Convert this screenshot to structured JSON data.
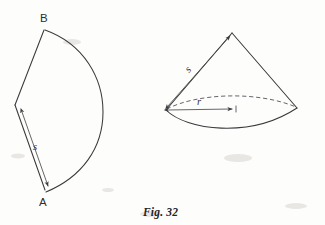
{
  "figure": {
    "caption": "Fig. 32",
    "background_color": "#fdfdfc",
    "ink_color": "#3a3a3c",
    "panels": [
      {
        "name": "sector-panel",
        "description": "flat circular sector unrolled, vertices A and B",
        "labels": [
          {
            "id": "vertex-b",
            "text": "B",
            "x": 44,
            "y": 22
          },
          {
            "id": "vertex-a",
            "text": "A",
            "x": 43,
            "y": 205
          },
          {
            "id": "slant-s",
            "text": "s",
            "x": 36,
            "y": 148
          }
        ],
        "dimension_arrows": [
          {
            "id": "sector-slant-arrow",
            "label": "s",
            "style": "double-headed"
          }
        ]
      },
      {
        "name": "cone-panel",
        "description": "right circular cone with elliptical base, dashed hidden rear arc",
        "labels": [
          {
            "id": "cone-slant-s",
            "text": "s",
            "x": 192,
            "y": 70
          },
          {
            "id": "cone-radius-r",
            "text": "r",
            "x": 200,
            "y": 104
          }
        ],
        "dimension_arrows": [
          {
            "id": "cone-slant-arrow",
            "label": "s",
            "style": "double-headed"
          },
          {
            "id": "cone-radius-arrow",
            "label": "r",
            "style": "double-headed"
          }
        ]
      }
    ]
  }
}
